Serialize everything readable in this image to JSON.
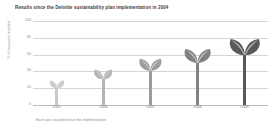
{
  "chart_data": {
    "type": "bar",
    "title": "Results since the Deloitte sustainability plan implementation in 2004",
    "xlabel": "Each year recorded since the implementation",
    "ylabel": "% of resources recycled",
    "categories": [
      "2005",
      "2006",
      "2007",
      "2008",
      "2009"
    ],
    "values": [
      30,
      43,
      56,
      68,
      80
    ],
    "ylim": [
      0,
      100
    ],
    "yticks": [
      "0",
      "20",
      "40",
      "60",
      "80",
      "100"
    ],
    "ytick_values": [
      0,
      20,
      40,
      60,
      80,
      100
    ],
    "grid": true,
    "legend": "none",
    "series_name": "% of resources recycled",
    "marker_style": "plant-sprout-icon",
    "colors": [
      "#c8c9cb",
      "#b4b5b7",
      "#9b9c9e",
      "#808184",
      "#58595b"
    ],
    "grid_color": "#d4d5d7",
    "background": "#ffffff"
  },
  "footnote": "Each year recorded since the implementation"
}
